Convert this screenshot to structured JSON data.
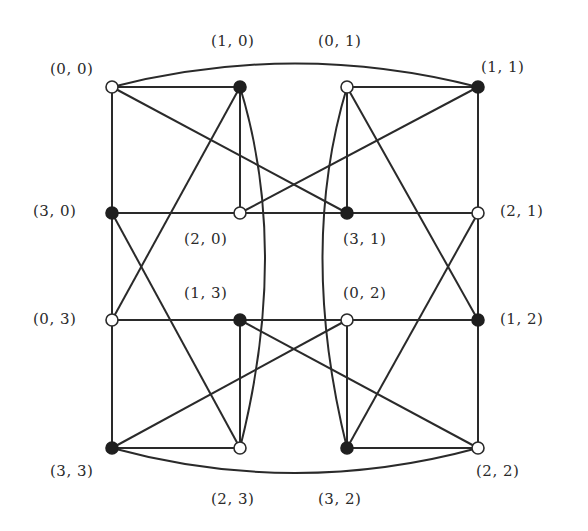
{
  "diagram": {
    "title": "",
    "line_color": "#2a2a2a",
    "node_colors": {
      "white": "#ffffff",
      "black": "#1f1f1f"
    },
    "nodes": [
      {
        "id": "0,0",
        "label": "(0, 0)",
        "x": 112,
        "y": 87,
        "color": "white",
        "label_x": 50,
        "label_y": 60
      },
      {
        "id": "1,0",
        "label": "(1, 0)",
        "x": 240,
        "y": 87,
        "color": "black",
        "label_x": 211,
        "label_y": 32
      },
      {
        "id": "0,1",
        "label": "(0, 1)",
        "x": 347,
        "y": 87,
        "color": "white",
        "label_x": 318,
        "label_y": 32
      },
      {
        "id": "1,1",
        "label": "(1, 1)",
        "x": 478,
        "y": 87,
        "color": "black",
        "label_x": 481,
        "label_y": 58
      },
      {
        "id": "3,0",
        "label": "(3, 0)",
        "x": 112,
        "y": 213,
        "color": "black",
        "label_x": 33,
        "label_y": 202
      },
      {
        "id": "2,0",
        "label": "(2, 0)",
        "x": 240,
        "y": 213,
        "color": "white",
        "label_x": 184,
        "label_y": 230
      },
      {
        "id": "3,1",
        "label": "(3, 1)",
        "x": 347,
        "y": 213,
        "color": "black",
        "label_x": 343,
        "label_y": 230
      },
      {
        "id": "2,1",
        "label": "(2, 1)",
        "x": 478,
        "y": 213,
        "color": "white",
        "label_x": 500,
        "label_y": 202
      },
      {
        "id": "0,3",
        "label": "(0, 3)",
        "x": 112,
        "y": 320,
        "color": "white",
        "label_x": 33,
        "label_y": 310
      },
      {
        "id": "1,3",
        "label": "(1, 3)",
        "x": 240,
        "y": 320,
        "color": "black",
        "label_x": 184,
        "label_y": 284
      },
      {
        "id": "0,2",
        "label": "(0, 2)",
        "x": 347,
        "y": 320,
        "color": "white",
        "label_x": 343,
        "label_y": 284
      },
      {
        "id": "1,2",
        "label": "(1, 2)",
        "x": 478,
        "y": 320,
        "color": "black",
        "label_x": 500,
        "label_y": 310
      },
      {
        "id": "3,3",
        "label": "(3, 3)",
        "x": 112,
        "y": 448,
        "color": "black",
        "label_x": 50,
        "label_y": 462
      },
      {
        "id": "2,3",
        "label": "(2, 3)",
        "x": 240,
        "y": 448,
        "color": "white",
        "label_x": 211,
        "label_y": 490
      },
      {
        "id": "3,2",
        "label": "(3, 2)",
        "x": 347,
        "y": 448,
        "color": "black",
        "label_x": 318,
        "label_y": 490
      },
      {
        "id": "2,2",
        "label": "(2, 2)",
        "x": 478,
        "y": 448,
        "color": "white",
        "label_x": 476,
        "label_y": 462
      }
    ],
    "edges": [
      {
        "from": "0,0",
        "to": "1,0",
        "type": "line"
      },
      {
        "from": "0,1",
        "to": "1,1",
        "type": "line"
      },
      {
        "from": "0,0",
        "to": "1,1",
        "type": "curve",
        "cx": 295,
        "cy": 40
      },
      {
        "from": "0,0",
        "to": "3,0",
        "type": "line"
      },
      {
        "from": "0,0",
        "to": "3,1",
        "type": "line"
      },
      {
        "from": "1,0",
        "to": "2,0",
        "type": "line"
      },
      {
        "from": "1,0",
        "to": "0,3",
        "type": "line"
      },
      {
        "from": "1,0",
        "to": "2,3",
        "type": "curve",
        "cx": 290,
        "cy": 250
      },
      {
        "from": "0,1",
        "to": "3,1",
        "type": "line"
      },
      {
        "from": "0,1",
        "to": "3,2",
        "type": "curve",
        "cx": 298,
        "cy": 250
      },
      {
        "from": "0,1",
        "to": "1,2",
        "type": "line"
      },
      {
        "from": "1,1",
        "to": "2,0",
        "type": "line"
      },
      {
        "from": "1,1",
        "to": "2,1",
        "type": "line"
      },
      {
        "from": "3,0",
        "to": "2,0",
        "type": "line"
      },
      {
        "from": "2,0",
        "to": "3,1",
        "type": "line"
      },
      {
        "from": "3,1",
        "to": "2,1",
        "type": "line"
      },
      {
        "from": "3,0",
        "to": "0,3",
        "type": "line"
      },
      {
        "from": "3,0",
        "to": "2,3",
        "type": "line"
      },
      {
        "from": "2,1",
        "to": "1,2",
        "type": "line"
      },
      {
        "from": "2,1",
        "to": "3,2",
        "type": "line"
      },
      {
        "from": "0,3",
        "to": "1,3",
        "type": "line"
      },
      {
        "from": "1,3",
        "to": "0,2",
        "type": "line"
      },
      {
        "from": "0,2",
        "to": "1,2",
        "type": "line"
      },
      {
        "from": "0,3",
        "to": "3,3",
        "type": "line"
      },
      {
        "from": "1,3",
        "to": "2,3",
        "type": "line"
      },
      {
        "from": "1,3",
        "to": "2,2",
        "type": "line"
      },
      {
        "from": "0,2",
        "to": "3,2",
        "type": "line"
      },
      {
        "from": "0,2",
        "to": "3,3",
        "type": "line"
      },
      {
        "from": "1,2",
        "to": "2,2",
        "type": "line"
      },
      {
        "from": "3,3",
        "to": "2,3",
        "type": "line"
      },
      {
        "from": "3,2",
        "to": "2,2",
        "type": "line"
      },
      {
        "from": "3,3",
        "to": "2,2",
        "type": "curve",
        "cx": 295,
        "cy": 498
      }
    ]
  }
}
